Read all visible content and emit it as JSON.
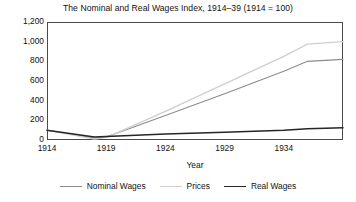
{
  "chart_data": {
    "type": "line",
    "title": "The Nominal and Real Wages Index, 1914–39 (1914 = 100)",
    "xlabel": "Year",
    "ylabel": "",
    "xlim": [
      1914,
      1939
    ],
    "ylim": [
      0,
      1200
    ],
    "grid": false,
    "legend_position": "bottom",
    "xticks": [
      1914,
      1919,
      1924,
      1929,
      1934
    ],
    "xtick_labels": [
      "1914",
      "1919",
      "1924",
      "1929",
      "1934"
    ],
    "yticks": [
      0,
      200,
      400,
      600,
      800,
      1000,
      1200
    ],
    "ytick_labels": [
      "0",
      "200",
      "400",
      "600",
      "800",
      "1,000",
      "1,200"
    ],
    "x": [
      1914,
      1918,
      1919,
      1924,
      1929,
      1934,
      1936,
      1939
    ],
    "series": [
      {
        "name": "Nominal Wages",
        "color": "#8c8c8c",
        "values": [
          100,
          20,
          30,
          250,
          470,
          700,
          800,
          820
        ]
      },
      {
        "name": "Prices",
        "color": "#cfcfcf",
        "values": [
          100,
          10,
          25,
          290,
          570,
          850,
          975,
          1000
        ]
      },
      {
        "name": "Real Wages",
        "color": "#262626",
        "values": [
          100,
          30,
          35,
          60,
          80,
          100,
          115,
          125
        ]
      }
    ]
  },
  "legend": {
    "items": [
      {
        "label": "Nominal Wages",
        "color": "#8c8c8c",
        "width": "1.2px"
      },
      {
        "label": "Prices",
        "color": "#cfcfcf",
        "width": "1.4px"
      },
      {
        "label": "Real Wages",
        "color": "#262626",
        "width": "1.6px"
      }
    ]
  }
}
